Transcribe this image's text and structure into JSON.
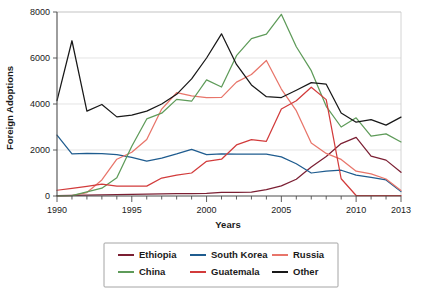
{
  "chart_data": {
    "type": "line",
    "title": "",
    "xlabel": "Years",
    "ylabel": "Foreign Adoptions",
    "xlim": [
      1990,
      2013
    ],
    "ylim": [
      0,
      8000
    ],
    "grid": true,
    "legend_position": "bottom",
    "x": [
      1990,
      1991,
      1992,
      1993,
      1994,
      1995,
      1996,
      1997,
      1998,
      1999,
      2000,
      2001,
      2002,
      2003,
      2004,
      2005,
      2006,
      2007,
      2008,
      2009,
      2010,
      2011,
      2012,
      2013
    ],
    "xticks": [
      1990,
      1995,
      2000,
      2005,
      2010,
      2013
    ],
    "xtick_labels": [
      "1990",
      "1995",
      "2000",
      "2005",
      "2010",
      "2013"
    ],
    "yticks": [
      0,
      2000,
      4000,
      6000,
      8000
    ],
    "ytick_labels": [
      "0",
      "2000",
      "4000",
      "6000",
      "8000"
    ],
    "series": [
      {
        "name": "Ethiopia",
        "color": "#7b1f33",
        "values": [
          20,
          30,
          40,
          50,
          60,
          70,
          80,
          90,
          100,
          100,
          110,
          160,
          160,
          170,
          280,
          440,
          730,
          1260,
          1720,
          2280,
          2550,
          1730,
          1560,
          1030
        ]
      },
      {
        "name": "South Korea",
        "color": "#1f5c8f",
        "values": [
          2650,
          1830,
          1850,
          1840,
          1800,
          1680,
          1520,
          1650,
          1830,
          2030,
          1800,
          1830,
          1820,
          1820,
          1820,
          1700,
          1400,
          1000,
          1080,
          1120,
          910,
          810,
          700,
          190
        ]
      },
      {
        "name": "Russia",
        "color": "#e8756a",
        "values": [
          10,
          20,
          150,
          700,
          1600,
          1900,
          2460,
          3780,
          4490,
          4350,
          4280,
          4290,
          4950,
          5280,
          5890,
          4650,
          3710,
          2300,
          1850,
          1590,
          1080,
          960,
          740,
          240
        ]
      },
      {
        "name": "China",
        "color": "#5e9b59",
        "values": [
          10,
          15,
          180,
          340,
          790,
          2160,
          3350,
          3600,
          4200,
          4120,
          5050,
          4740,
          6100,
          6840,
          7040,
          7900,
          6490,
          5450,
          3900,
          3000,
          3400,
          2600,
          2700,
          2350
        ]
      },
      {
        "name": "Guatemala",
        "color": "#d23b3b",
        "values": [
          250,
          330,
          420,
          520,
          430,
          430,
          430,
          780,
          910,
          1000,
          1510,
          1600,
          2220,
          2450,
          2380,
          3780,
          4140,
          4730,
          4190,
          750,
          20,
          20,
          20,
          20
        ]
      },
      {
        "name": "Other",
        "color": "#181818",
        "values": [
          4150,
          6750,
          3690,
          3980,
          3440,
          3520,
          3690,
          4000,
          4420,
          5090,
          6000,
          7050,
          5720,
          4830,
          4320,
          4280,
          4600,
          4930,
          4860,
          3610,
          3210,
          3320,
          3080,
          3430
        ]
      }
    ]
  },
  "legend": {
    "entries": [
      {
        "label": "Ethiopia",
        "color": "#7b1f33"
      },
      {
        "label": "South Korea",
        "color": "#1f5c8f"
      },
      {
        "label": "Russia",
        "color": "#e8756a"
      },
      {
        "label": "China",
        "color": "#5e9b59"
      },
      {
        "label": "Guatemala",
        "color": "#d23b3b"
      },
      {
        "label": "Other",
        "color": "#181818"
      }
    ]
  }
}
